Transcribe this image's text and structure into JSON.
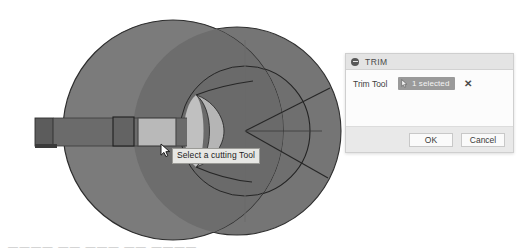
{
  "app": {
    "kind": "cad-3d-viewport"
  },
  "viewport": {
    "background_color": "#ffffff",
    "shapes": {
      "left_sphere_color": "#7b7b7b",
      "right_sphere_color": "#757575",
      "overlap_color": "#6d6d6d",
      "lens_highlight_color": "#b4b4b4",
      "bar_color": "#6b6b6b",
      "bar_end_color": "#5c5c5c",
      "selected_face_color": "#b9b9b9",
      "edge_color": "#2c2c2c",
      "dark_rect_color": "#636363"
    }
  },
  "tooltip": {
    "text": "Select a cutting Tool"
  },
  "cursor": {
    "name": "arrow-pointer"
  },
  "dialog": {
    "title": "TRIM",
    "collapse_icon": "minus-circle-icon",
    "field": {
      "label": "Trim Tool",
      "chip_icon": "cursor-select-icon",
      "chip_text": "1 selected",
      "clear_label": "✕"
    },
    "buttons": {
      "ok": "OK",
      "cancel": "Cancel"
    },
    "colors": {
      "titlebar": "#e4e4e4",
      "body": "#fcfcfc",
      "footer": "#e9e9e9",
      "chip": "#9a9a9a"
    }
  },
  "bottom_strip": {
    "text": "————  ——  ———  ——  ————"
  }
}
